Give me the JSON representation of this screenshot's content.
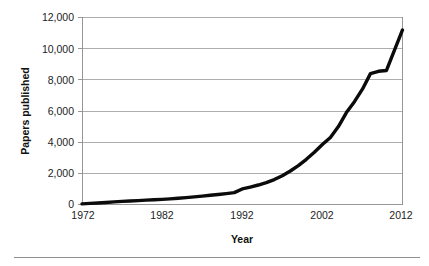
{
  "chart_data": {
    "type": "line",
    "title": "",
    "xlabel": "Year",
    "ylabel": "Papers published",
    "xlim": [
      1972,
      2012
    ],
    "ylim": [
      0,
      12000
    ],
    "grid": true,
    "legend": false,
    "legend_position": "none",
    "line_color": "#0b0b0b",
    "gridline_color": "#9a9a9a",
    "axis_color": "#8c8c8c",
    "background_color": "#ffffff",
    "x_ticks": [
      "1972",
      "1982",
      "1992",
      "2002",
      "2012"
    ],
    "x_tick_values": [
      1972,
      1982,
      1992,
      2002,
      2012
    ],
    "y_ticks": [
      "0",
      "2,000",
      "4,000",
      "6,000",
      "8,000",
      "10,000",
      "12,000"
    ],
    "y_tick_values": [
      0,
      2000,
      4000,
      6000,
      8000,
      10000,
      12000
    ],
    "x": [
      1972,
      1973,
      1974,
      1975,
      1976,
      1977,
      1978,
      1979,
      1980,
      1981,
      1982,
      1983,
      1984,
      1985,
      1986,
      1987,
      1988,
      1989,
      1990,
      1991,
      1992,
      1993,
      1994,
      1995,
      1996,
      1997,
      1998,
      1999,
      2000,
      2001,
      2002,
      2003,
      2004,
      2005,
      2006,
      2007,
      2008,
      2009,
      2010,
      2011,
      2012
    ],
    "values": [
      40,
      70,
      100,
      130,
      170,
      200,
      220,
      250,
      280,
      300,
      330,
      360,
      400,
      440,
      490,
      540,
      590,
      640,
      700,
      760,
      1000,
      1120,
      1250,
      1400,
      1600,
      1850,
      2150,
      2500,
      2900,
      3350,
      3850,
      4300,
      5000,
      5900,
      6600,
      7400,
      8400,
      8550,
      8600,
      9900,
      11200
    ],
    "series": [
      {
        "name": "Papers published",
        "values": [
          40,
          70,
          100,
          130,
          170,
          200,
          220,
          250,
          280,
          300,
          330,
          360,
          400,
          440,
          490,
          540,
          590,
          640,
          700,
          760,
          1000,
          1120,
          1250,
          1400,
          1600,
          1850,
          2150,
          2500,
          2900,
          3350,
          3850,
          4300,
          5000,
          5900,
          6600,
          7400,
          8400,
          8550,
          8600,
          9900,
          11200
        ]
      }
    ]
  },
  "figure": {
    "yaxis_title": "Papers published",
    "xaxis_title": "Year"
  }
}
